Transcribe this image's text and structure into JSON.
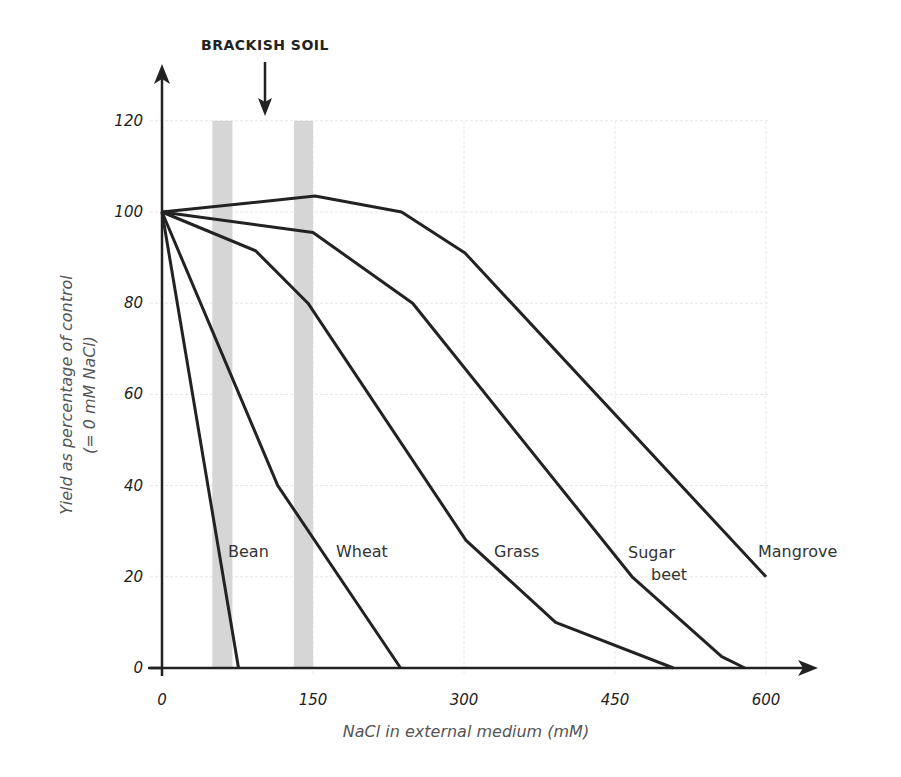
{
  "chart_data": {
    "type": "line",
    "title": "",
    "xlabel": "NaCl in external medium (mM)",
    "ylabel": "Yield as percentage of control",
    "ylabel_sub": "(= 0 mM NaCl)",
    "xlim": [
      0,
      600
    ],
    "ylim": [
      0,
      120
    ],
    "x_ticks": [
      0,
      150,
      300,
      450,
      600
    ],
    "y_ticks": [
      0,
      20,
      40,
      60,
      80,
      100,
      120
    ],
    "grid": true,
    "legend": "inline labels",
    "annotations": [
      {
        "text": "BRACKISH SOIL",
        "type": "arrow",
        "x": 100
      }
    ],
    "shaded_bands": [
      {
        "x0": 50,
        "x1": 70
      },
      {
        "x0": 131,
        "x1": 150
      }
    ],
    "series": [
      {
        "name": "Bean",
        "x": [
          0,
          76
        ],
        "y": [
          100,
          0
        ],
        "label_pos": [
          66,
          25
        ]
      },
      {
        "name": "Wheat",
        "x": [
          0,
          115,
          237
        ],
        "y": [
          100,
          40,
          0
        ],
        "label_pos": [
          173,
          25
        ]
      },
      {
        "name": "Grass",
        "x": [
          0,
          93,
          145,
          302,
          391,
          508
        ],
        "y": [
          100,
          91.5,
          80,
          28,
          10,
          0
        ],
        "label_pos": [
          330,
          25
        ]
      },
      {
        "name": "Sugar beet",
        "x": [
          0,
          150,
          249,
          467,
          556,
          579
        ],
        "y": [
          100,
          95.5,
          80,
          20,
          2.5,
          0
        ],
        "label_pos": [
          465,
          25
        ]
      },
      {
        "name": "Mangrove",
        "x": [
          0,
          152,
          238,
          301,
          600
        ],
        "y": [
          100,
          103.5,
          100,
          91,
          20
        ],
        "label_pos": [
          595,
          25
        ]
      }
    ]
  },
  "labels": {
    "annotation": "BRACKISH SOIL",
    "xlabel": "NaCl in external medium (mM)",
    "ylabel": "Yield as percentage of control",
    "ylabel_sub": "(= 0 mM NaCl)",
    "series": [
      "Bean",
      "Wheat",
      "Grass",
      "Sugar",
      "beet",
      "Mangrove"
    ],
    "x_ticks": [
      "0",
      "150",
      "300",
      "450",
      "600"
    ],
    "y_ticks": [
      "0",
      "20",
      "40",
      "60",
      "80",
      "100",
      "120"
    ]
  },
  "colors": {
    "line": "#222222",
    "band": "#d6d6d6",
    "grid": "#e6e6e6"
  }
}
